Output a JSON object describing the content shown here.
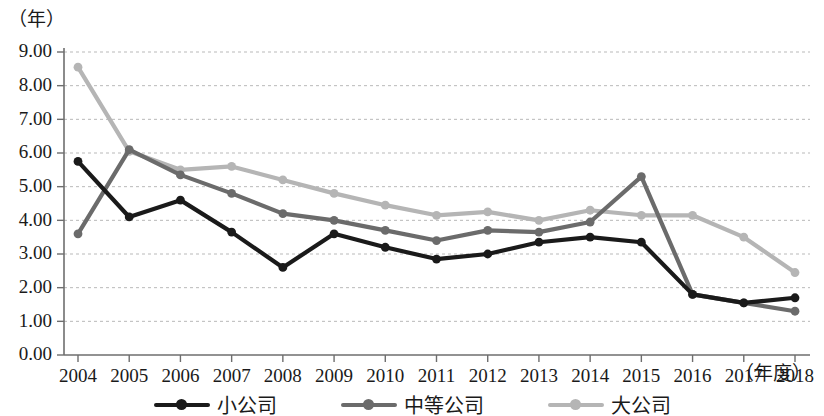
{
  "chart_data": {
    "type": "line",
    "title": "",
    "subtitle": "",
    "xlabel": "（年度）",
    "ylabel": "（年）",
    "x": [
      "2004",
      "2005",
      "2006",
      "2007",
      "2008",
      "2009",
      "2010",
      "2011",
      "2012",
      "2013",
      "2014",
      "2015",
      "2016",
      "2017",
      "2018"
    ],
    "categories": [
      "2004",
      "2005",
      "2006",
      "2007",
      "2008",
      "2009",
      "2010",
      "2011",
      "2012",
      "2013",
      "2014",
      "2015",
      "2016",
      "2017",
      "2018"
    ],
    "ylim": [
      0.0,
      9.0
    ],
    "ytick_labels": [
      "0.00",
      "1.00",
      "2.00",
      "3.00",
      "4.00",
      "5.00",
      "6.00",
      "7.00",
      "8.00",
      "9.00"
    ],
    "ytick_values": [
      0.0,
      1.0,
      2.0,
      3.0,
      4.0,
      5.0,
      6.0,
      7.0,
      8.0,
      9.0
    ],
    "grid": true,
    "legend_position": "bottom",
    "series": [
      {
        "name": "小公司",
        "color": "#1a1a1a",
        "values": [
          5.75,
          4.1,
          4.6,
          3.65,
          2.6,
          3.6,
          3.2,
          2.85,
          3.0,
          3.35,
          3.5,
          3.35,
          1.8,
          1.55,
          1.7
        ]
      },
      {
        "name": "中等公司",
        "color": "#6b6b6b",
        "values": [
          3.6,
          6.1,
          5.35,
          4.8,
          4.2,
          4.0,
          3.7,
          3.4,
          3.7,
          3.65,
          3.95,
          5.3,
          1.8,
          1.55,
          1.3
        ]
      },
      {
        "name": "大公司",
        "color": "#b5b5b5",
        "values": [
          8.55,
          6.05,
          5.5,
          5.6,
          5.2,
          4.8,
          4.45,
          4.15,
          4.25,
          4.0,
          4.3,
          4.15,
          4.15,
          3.5,
          2.45
        ]
      }
    ]
  },
  "legend": {
    "items": [
      {
        "label": "小公司",
        "color": "#1a1a1a"
      },
      {
        "label": "中等公司",
        "color": "#6b6b6b"
      },
      {
        "label": "大公司",
        "color": "#b5b5b5"
      }
    ]
  },
  "axes": {
    "y_unit_label": "（年）",
    "x_unit_label": "（年度）"
  }
}
